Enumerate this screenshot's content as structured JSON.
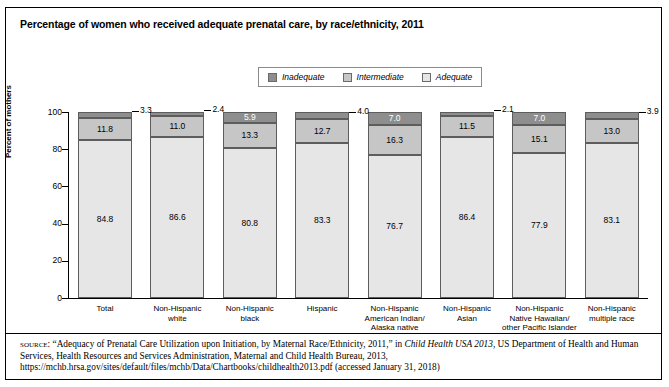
{
  "title": "Percentage of women who received adequate prenatal care, by race/ethnicity, 2011",
  "legend": {
    "items": [
      {
        "label": "Inadequate",
        "color": "#8e8e8e"
      },
      {
        "label": "Intermediate",
        "color": "#c6c6c6"
      },
      {
        "label": "Adequate",
        "color": "#e6e6e6"
      }
    ]
  },
  "axis": {
    "ylabel": "Percent of mothers",
    "yticks": [
      "0",
      "20",
      "40",
      "60",
      "80",
      "100"
    ]
  },
  "source": {
    "prefix": "source:",
    "line1_a": " “Adequacy of Prenatal Care Utilization upon Initiation, by Maternal Race/Ethnicity, 2011,” in ",
    "italic1": "Child Health USA 2013",
    "line1_b": ", US Department of Health and Human Services, Health Resources and Services Administration, Maternal and Child Health Bureau, 2013, https://mchb.hrsa.gov/sites/default/files/mchb/Data/Chartbooks/childhealth2013.pdf (accessed January 31, 2018)"
  },
  "chart_data": {
    "type": "bar",
    "subtype": "stacked-vertical-100",
    "title": "Percentage of women who received adequate prenatal care, by race/ethnicity, 2011",
    "xlabel": "",
    "ylabel": "Percent of mothers",
    "ylim": [
      0,
      100
    ],
    "yticks": [
      0,
      20,
      40,
      60,
      80,
      100
    ],
    "grid": false,
    "legend_position": "top-center",
    "categories": [
      "Total",
      "Non-Hispanic white",
      "Non-Hispanic black",
      "Hispanic",
      "Non-Hispanic American Indian/ Alaska native",
      "Non-Hispanic Asian",
      "Non-Hispanic Native Hawaiian/ other Pacific Islander",
      "Non-Hispanic multiple race"
    ],
    "category_lines": [
      [
        "Total"
      ],
      [
        "Non-Hispanic",
        "white"
      ],
      [
        "Non-Hispanic",
        "black"
      ],
      [
        "Hispanic"
      ],
      [
        "Non-Hispanic",
        "American Indian/",
        "Alaska native"
      ],
      [
        "Non-Hispanic",
        "Asian"
      ],
      [
        "Non-Hispanic",
        "Native Hawaiian/",
        "other Pacific Islander"
      ],
      [
        "Non-Hispanic",
        "multiple race"
      ]
    ],
    "series": [
      {
        "name": "Adequate",
        "color": "#e6e6e6",
        "values": [
          84.8,
          86.6,
          80.8,
          83.3,
          76.7,
          86.4,
          77.9,
          83.1
        ]
      },
      {
        "name": "Intermediate",
        "color": "#c6c6c6",
        "values": [
          11.8,
          11.0,
          13.3,
          12.7,
          16.3,
          11.5,
          15.1,
          13.0
        ]
      },
      {
        "name": "Inadequate",
        "color": "#8e8e8e",
        "values": [
          3.3,
          2.4,
          5.9,
          4.0,
          7.0,
          2.1,
          7.0,
          3.9
        ]
      }
    ],
    "inadequate_label_placement": [
      "outside",
      "outside",
      "inside",
      "outside",
      "inside",
      "outside",
      "inside",
      "outside"
    ]
  }
}
